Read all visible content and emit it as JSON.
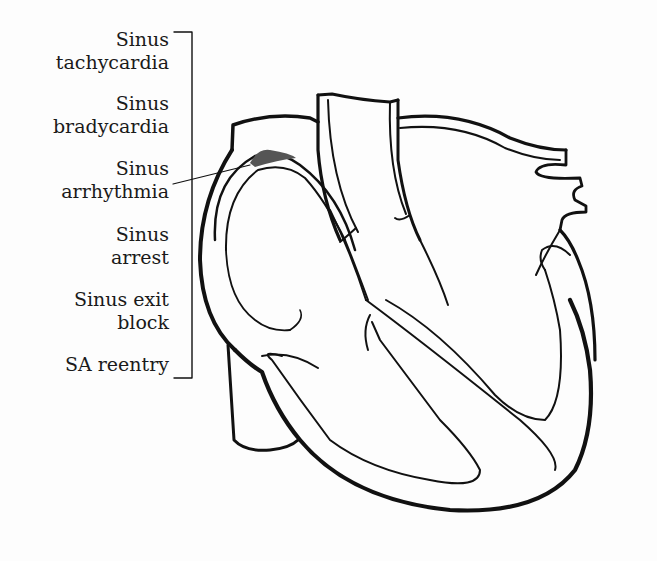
{
  "diagram": {
    "highlight": {
      "name": "SA node",
      "color": "#555555"
    },
    "bracket_labels": [
      {
        "line1": "Sinus",
        "line2": "tachycardia"
      },
      {
        "line1": "Sinus",
        "line2": "bradycardia"
      },
      {
        "line1": "Sinus",
        "line2": "arrhythmia"
      },
      {
        "line1": "Sinus",
        "line2": "arrest"
      },
      {
        "line1": "Sinus exit",
        "line2": "block"
      },
      {
        "line1": "SA reentry",
        "line2": ""
      }
    ],
    "colors": {
      "outline": "#111111",
      "background": "#fdfdfd",
      "text": "#1a1a1a"
    }
  }
}
